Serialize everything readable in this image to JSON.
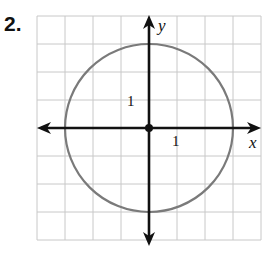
{
  "problem": {
    "number": "2."
  },
  "chart_data": {
    "type": "line",
    "title": "",
    "shape": {
      "kind": "circle",
      "center": [
        0,
        0
      ],
      "radius": 3,
      "equation": "x^2 + y^2 = 9"
    },
    "xlabel": "x",
    "ylabel": "y",
    "xlim": [
      -4,
      4
    ],
    "ylim": [
      -4,
      4
    ],
    "grid": true,
    "tick_labels": {
      "x": [
        "1"
      ],
      "y": [
        "1"
      ]
    },
    "origin_marked": true,
    "colors": {
      "circle": "#7a7a7a",
      "axes": "#111111",
      "grid": "#c8c8c8"
    }
  },
  "labels": {
    "x_axis": "x",
    "y_axis": "y",
    "x_tick": "1",
    "y_tick": "1"
  }
}
